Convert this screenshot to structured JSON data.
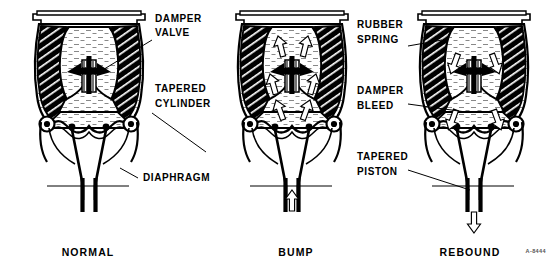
{
  "figure": {
    "code": "A-8444",
    "background_color": "#ffffff",
    "ink_color": "#000000"
  },
  "callouts": [
    {
      "id": "damper-valve",
      "label_line1": "DAMPER",
      "label_line2": "VALVE",
      "x": 155,
      "y": 22,
      "panel": "normal"
    },
    {
      "id": "tapered-cylinder",
      "label_line1": "TAPERED",
      "label_line2": "CYLINDER",
      "x": 155,
      "y": 92,
      "panel": "normal"
    },
    {
      "id": "diaphragm",
      "label_line1": "DIAPHRAGM",
      "label_line2": "",
      "x": 143,
      "y": 178,
      "panel": "normal"
    },
    {
      "id": "rubber-spring",
      "label_line1": "RUBBER",
      "label_line2": "SPRING",
      "x": 357,
      "y": 28,
      "panel": "rebound"
    },
    {
      "id": "damper-bleed",
      "label_line1": "DAMPER",
      "label_line2": "BLEED",
      "x": 357,
      "y": 94,
      "panel": "rebound"
    },
    {
      "id": "tapered-piston",
      "label_line1": "TAPERED",
      "label_line2": "PISTON",
      "x": 357,
      "y": 157,
      "panel": "rebound"
    }
  ],
  "panels": [
    {
      "id": "normal",
      "caption": "NORMAL",
      "caption_x": 88,
      "state_description": "Static ride height; no fluid flow arrows shown.",
      "flow_arrows": [],
      "rod_arrow": "none"
    },
    {
      "id": "bump",
      "caption": "BUMP",
      "caption_x": 296,
      "state_description": "Piston driven upward; fluid displaced upward through damper valve.",
      "flow_arrows": [
        {
          "direction": "up",
          "position": "upper-left-chamber"
        },
        {
          "direction": "up",
          "position": "upper-right-chamber"
        },
        {
          "direction": "up",
          "position": "mid-left"
        },
        {
          "direction": "up",
          "position": "mid-right"
        },
        {
          "direction": "up",
          "position": "lower-left"
        },
        {
          "direction": "up",
          "position": "lower-right"
        }
      ],
      "rod_arrow": "up"
    },
    {
      "id": "rebound",
      "caption": "REBOUND",
      "caption_x": 470,
      "state_description": "Piston withdrawing; fluid returns downward past damper valve and bleed.",
      "flow_arrows": [
        {
          "direction": "down",
          "position": "upper-left-of-valve"
        },
        {
          "direction": "down",
          "position": "upper-right-of-valve"
        },
        {
          "direction": "down",
          "position": "lower-left-chamber"
        },
        {
          "direction": "down",
          "position": "lower-right-chamber"
        }
      ],
      "rod_arrow": "down"
    }
  ],
  "legend_keys": {
    "hatched_black": "rubber spring (diagonal hatching)",
    "stippled_grey": "hydraulic fluid (stipple)",
    "white_outline_arrow": "fluid flow direction"
  }
}
